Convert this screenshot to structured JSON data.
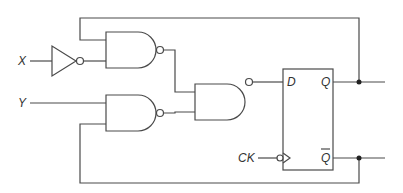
{
  "diagram": {
    "type": "sequential logic circuit",
    "inputs": {
      "x": "X",
      "y": "Y",
      "clock": "CK"
    },
    "flip_flop": {
      "type": "D flip-flop (negative-edge clock)",
      "d_label": "D",
      "q_label": "Q",
      "qbar_label": "Q"
    },
    "gates": [
      {
        "name": "inverter",
        "input": "X"
      },
      {
        "name": "nand-1",
        "inputs": [
          "Q",
          "X'"
        ]
      },
      {
        "name": "nand-2",
        "inputs": [
          "Y",
          "Q'"
        ]
      },
      {
        "name": "nand-3",
        "inputs": [
          "nand-1",
          "nand-2"
        ],
        "output": "D"
      }
    ],
    "colors": {
      "line": "#4a4a4a",
      "background": "#ffffff"
    }
  }
}
